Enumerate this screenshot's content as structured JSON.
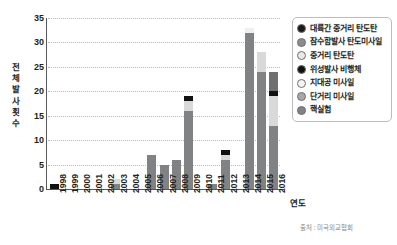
{
  "chart_data": {
    "type": "bar",
    "stacked": true,
    "title": "",
    "xlabel": "연도",
    "ylabel": "전체 발사 횟수",
    "ylim": [
      0,
      35
    ],
    "yticks": [
      0,
      5,
      10,
      15,
      20,
      25,
      30,
      35
    ],
    "grid": true,
    "legend_position": "right",
    "categories": [
      "1998",
      "1999",
      "2000",
      "2001",
      "2002",
      "2003",
      "2004",
      "2005",
      "2006",
      "2007",
      "2008",
      "2009",
      "2010",
      "2011",
      "2012",
      "2013",
      "2014",
      "2015",
      "2016"
    ],
    "series": [
      {
        "name": "대륙간 중거리 탄도탄",
        "color": "#1a1a1a",
        "values": [
          0,
          0,
          0,
          0,
          0,
          0,
          0,
          0,
          0,
          0,
          0,
          0,
          0,
          0,
          0,
          0,
          0,
          0,
          0
        ]
      },
      {
        "name": "잠수함발사 탄도미사일",
        "color": "#6f7072",
        "values": [
          0,
          0,
          0,
          0,
          0,
          0,
          0,
          0,
          0,
          0,
          0,
          0,
          0,
          0,
          0,
          0,
          0,
          0,
          4
        ]
      },
      {
        "name": "중거리 탄도탄",
        "color": "#d9d9d9",
        "values": [
          0,
          0,
          0,
          0,
          0,
          1,
          0,
          0,
          0,
          0,
          0,
          2,
          0,
          0,
          1,
          0,
          0,
          4,
          6
        ]
      },
      {
        "name": "위성발사 비행체",
        "color": "#111111",
        "values": [
          1,
          0,
          0,
          0,
          0,
          0,
          0,
          0,
          0,
          0,
          0,
          1,
          0,
          0,
          1,
          0,
          0,
          0,
          1
        ]
      },
      {
        "name": "지대공 미사일",
        "color": "#efefef",
        "values": [
          0,
          0,
          0,
          0,
          0,
          0,
          0,
          0,
          0,
          0,
          0,
          0,
          0,
          0,
          0,
          0,
          1,
          0,
          0
        ]
      },
      {
        "name": "단거리 미사일",
        "color": "#808284",
        "values": [
          0,
          0,
          0,
          0,
          0,
          1,
          0,
          0,
          7,
          5,
          6,
          16,
          0,
          1,
          6,
          0,
          32,
          24,
          13
        ]
      },
      {
        "name": "핵실험",
        "color": "#808284",
        "values": [
          0,
          0,
          0,
          0,
          0,
          0,
          0,
          0,
          0,
          0,
          0,
          0,
          0,
          0,
          0,
          0,
          0,
          0,
          0
        ]
      }
    ],
    "bar_totals": [
      1,
      0,
      0,
      0,
      0,
      2,
      0,
      0,
      7,
      5,
      6,
      19,
      0,
      1,
      8,
      0,
      33,
      28,
      24
    ],
    "source": "출처 : 미국외교협회"
  },
  "legend": {
    "items": [
      {
        "label": "대륙간 중거리 탄도탄",
        "color": "#1a1a1a"
      },
      {
        "label": "잠수함발사 탄도미사일",
        "color": "#8a8c8e"
      },
      {
        "label": "중거리 탄도탄",
        "color": "#e8e8e8"
      },
      {
        "label": "위성발사 비행체",
        "color": "#111111"
      },
      {
        "label": "지대공 미사일",
        "color": "#f4f4f4"
      },
      {
        "label": "단거리 미사일",
        "color": "#a6a8ab"
      },
      {
        "label": "핵실험",
        "color": "#808284"
      }
    ]
  },
  "axes": {
    "y_title_chars": [
      "전",
      "체",
      "발",
      "사",
      "횟",
      "수"
    ],
    "x_title": "연도",
    "y_ticks": [
      "35",
      "30",
      "25",
      "20",
      "15",
      "10",
      "5",
      "0"
    ]
  },
  "footer": {
    "source": "출처 : 미국외교협회"
  }
}
